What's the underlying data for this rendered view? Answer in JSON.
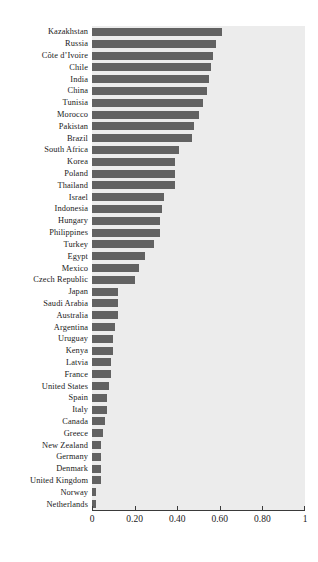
{
  "chart_data": {
    "type": "bar",
    "orientation": "horizontal",
    "title": "",
    "subtitle": "",
    "xlabel": "",
    "ylabel": "",
    "xlim": [
      0,
      1
    ],
    "ylim": null,
    "grid": false,
    "legend": null,
    "legend_position": "none",
    "bar_color": "#626262",
    "plot_background": "#ececec",
    "page_background": "#ffffff",
    "axis_color": "#3a3a3a",
    "text_color": "#1a1a1a",
    "x_ticks": [
      {
        "value": 0,
        "label": "0"
      },
      {
        "value": 0.2,
        "label": "0.20"
      },
      {
        "value": 0.4,
        "label": "0.40"
      },
      {
        "value": 0.6,
        "label": "0.60"
      },
      {
        "value": 0.8,
        "label": "0.80"
      },
      {
        "value": 1,
        "label": "1"
      }
    ],
    "categories": [
      "Kazakhstan",
      "Russia",
      "Côte d’Ivoire",
      "Chile",
      "India",
      "China",
      "Tunisia",
      "Morocco",
      "Pakistan",
      "Brazil",
      "South Africa",
      "Korea",
      "Poland",
      "Thailand",
      "Israel",
      "Indonesia",
      "Hungary",
      "Philippines",
      "Turkey",
      "Egypt",
      "Mexico",
      "Czech Republic",
      "Japan",
      "Saudi Arabia",
      "Australia",
      "Argentina",
      "Uruguay",
      "Kenya",
      "Latvia",
      "France",
      "United States",
      "Spain",
      "Italy",
      "Canada",
      "Greece",
      "New Zealand",
      "Germany",
      "Denmark",
      "United Kingdom",
      "Norway",
      "Netherlands"
    ],
    "values": [
      0.61,
      0.58,
      0.57,
      0.56,
      0.55,
      0.54,
      0.52,
      0.5,
      0.48,
      0.47,
      0.41,
      0.39,
      0.39,
      0.39,
      0.34,
      0.33,
      0.32,
      0.32,
      0.29,
      0.25,
      0.22,
      0.2,
      0.12,
      0.12,
      0.12,
      0.11,
      0.1,
      0.1,
      0.09,
      0.09,
      0.08,
      0.07,
      0.07,
      0.06,
      0.05,
      0.04,
      0.04,
      0.04,
      0.04,
      0.02,
      0.02
    ]
  }
}
